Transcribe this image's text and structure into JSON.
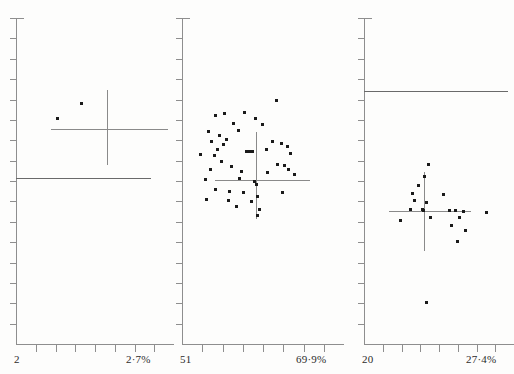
{
  "figure": {
    "type": "multi-panel-scatter",
    "panel_count": 3,
    "background_color": "#fdfdfc",
    "point_color": "#1a1a1a",
    "axis_color": "#8e8e8e",
    "caption_fragment": ""
  },
  "chart_data": [
    {
      "type": "scatter",
      "title": "",
      "xlabel": "",
      "ylabel": "",
      "panel_index": 1,
      "axis_low_label": "2",
      "axis_high_label": "2·7%",
      "xlim": [
        2,
        2.7
      ],
      "ylim": [
        0,
        16
      ],
      "grid": false,
      "legend": "none",
      "x_tick_count": 7,
      "y_tick_count": 16,
      "n_points": 2,
      "points": [
        {
          "x": 2.19,
          "y": 11.05
        },
        {
          "x": 2.3,
          "y": 11.8
        }
      ],
      "crosshair": {
        "x": 2.42,
        "y": 10.55,
        "x_min": 2.16,
        "x_max": 2.7,
        "y_min": 8.75,
        "y_max": 12.45
      },
      "reference_line": {
        "y": 8.15,
        "x_from": 2.0,
        "x_to": 2.62
      }
    },
    {
      "type": "scatter",
      "title": "",
      "xlabel": "",
      "ylabel": "",
      "panel_index": 2,
      "axis_low_label": "51",
      "axis_high_label": "69·9%",
      "xlim": [
        51,
        69.9
      ],
      "ylim": [
        0,
        16
      ],
      "grid": false,
      "legend": "none",
      "x_tick_count": 7,
      "y_tick_count": 16,
      "n_points": 48,
      "points": [
        {
          "x": 62.4,
          "y": 11.95
        },
        {
          "x": 56.2,
          "y": 11.3
        },
        {
          "x": 55.0,
          "y": 11.22
        },
        {
          "x": 58.6,
          "y": 11.35
        },
        {
          "x": 59.9,
          "y": 11.05
        },
        {
          "x": 57.2,
          "y": 10.8
        },
        {
          "x": 60.8,
          "y": 10.75
        },
        {
          "x": 54.2,
          "y": 10.45
        },
        {
          "x": 57.8,
          "y": 10.5
        },
        {
          "x": 55.6,
          "y": 10.25
        },
        {
          "x": 56.4,
          "y": 10.05
        },
        {
          "x": 54.6,
          "y": 9.95
        },
        {
          "x": 56.0,
          "y": 9.8
        },
        {
          "x": 62.0,
          "y": 9.95
        },
        {
          "x": 63.0,
          "y": 9.85
        },
        {
          "x": 63.8,
          "y": 9.7
        },
        {
          "x": 61.2,
          "y": 9.55
        },
        {
          "x": 55.3,
          "y": 9.55
        },
        {
          "x": 58.8,
          "y": 9.45
        },
        {
          "x": 59.2,
          "y": 9.45
        },
        {
          "x": 59.6,
          "y": 9.45
        },
        {
          "x": 53.2,
          "y": 9.3
        },
        {
          "x": 54.9,
          "y": 9.25
        },
        {
          "x": 64.2,
          "y": 9.35
        },
        {
          "x": 55.8,
          "y": 8.95
        },
        {
          "x": 62.6,
          "y": 8.8
        },
        {
          "x": 63.4,
          "y": 8.75
        },
        {
          "x": 57.0,
          "y": 8.7
        },
        {
          "x": 54.4,
          "y": 8.55
        },
        {
          "x": 63.9,
          "y": 8.55
        },
        {
          "x": 58.2,
          "y": 8.45
        },
        {
          "x": 61.4,
          "y": 8.4
        },
        {
          "x": 64.6,
          "y": 8.3
        },
        {
          "x": 58.0,
          "y": 8.1
        },
        {
          "x": 53.8,
          "y": 8.05
        },
        {
          "x": 59.8,
          "y": 8.0
        },
        {
          "x": 60.0,
          "y": 7.85
        },
        {
          "x": 55.1,
          "y": 7.6
        },
        {
          "x": 56.8,
          "y": 7.5
        },
        {
          "x": 58.4,
          "y": 7.45
        },
        {
          "x": 63.2,
          "y": 7.45
        },
        {
          "x": 60.2,
          "y": 7.25
        },
        {
          "x": 54.0,
          "y": 7.1
        },
        {
          "x": 56.6,
          "y": 7.05
        },
        {
          "x": 59.4,
          "y": 7.0
        },
        {
          "x": 57.6,
          "y": 6.75
        },
        {
          "x": 60.4,
          "y": 6.6
        },
        {
          "x": 60.1,
          "y": 6.3
        }
      ],
      "crosshair": {
        "x": 60.0,
        "y": 8.05,
        "x_min": 55.0,
        "x_max": 66.5,
        "y_min": 6.15,
        "y_max": 10.4
      },
      "reference_line": null
    },
    {
      "type": "scatter",
      "title": "",
      "xlabel": "",
      "ylabel": "",
      "panel_index": 3,
      "axis_low_label": "20",
      "axis_high_label": "27·4%",
      "xlim": [
        20,
        27.4
      ],
      "ylim": [
        0,
        16
      ],
      "grid": false,
      "legend": "none",
      "x_tick_count": 7,
      "y_tick_count": 16,
      "n_points": 20,
      "points": [
        {
          "x": 23.3,
          "y": 8.8
        },
        {
          "x": 23.1,
          "y": 8.2
        },
        {
          "x": 22.8,
          "y": 7.8
        },
        {
          "x": 22.5,
          "y": 7.4
        },
        {
          "x": 24.1,
          "y": 7.35
        },
        {
          "x": 22.6,
          "y": 7.05
        },
        {
          "x": 23.2,
          "y": 6.95
        },
        {
          "x": 22.4,
          "y": 6.62
        },
        {
          "x": 23.0,
          "y": 6.58
        },
        {
          "x": 23.05,
          "y": 6.55
        },
        {
          "x": 24.4,
          "y": 6.55
        },
        {
          "x": 24.7,
          "y": 6.55
        },
        {
          "x": 25.1,
          "y": 6.5
        },
        {
          "x": 26.3,
          "y": 6.45
        },
        {
          "x": 23.4,
          "y": 6.2
        },
        {
          "x": 24.9,
          "y": 6.22
        },
        {
          "x": 21.9,
          "y": 6.05
        },
        {
          "x": 24.5,
          "y": 5.8
        },
        {
          "x": 25.2,
          "y": 5.55
        },
        {
          "x": 24.8,
          "y": 5.05
        },
        {
          "x": 23.2,
          "y": 2.05
        }
      ],
      "crosshair": {
        "x": 23.1,
        "y": 6.55,
        "x_min": 21.3,
        "x_max": 25.5,
        "y_min": 4.55,
        "y_max": 8.45
      },
      "reference_line": {
        "y": 12.4,
        "x_from": 20.0,
        "x_to": 27.4
      }
    }
  ]
}
